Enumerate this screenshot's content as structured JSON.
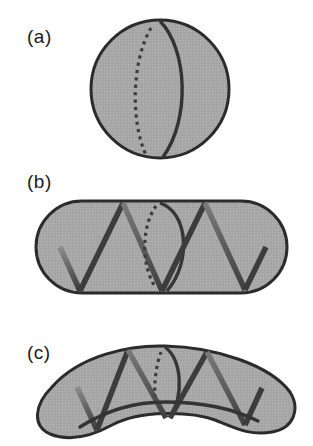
{
  "figure": {
    "panels": [
      {
        "id": "a",
        "label": "(a)",
        "shape": "sphere",
        "description": "Sphere with one ring: solid front arc and dotted back arc"
      },
      {
        "id": "b",
        "label": "(b)",
        "shape": "capsule",
        "description": "Rod-shaped capsule with helical zigzag filament and a ring"
      },
      {
        "id": "c",
        "label": "(c)",
        "shape": "curved-rod",
        "description": "Curved (crescent) rod with helical filament, ring, and longitudinal inner arc"
      }
    ],
    "colors": {
      "fill": "#a9a9a9",
      "outline": "#2b2b2b",
      "strand_dark": "#3a3a3a",
      "strand_light": "#8c8c8c",
      "ring": "#3c3c3c",
      "dotted": "#3c3c3c"
    }
  }
}
